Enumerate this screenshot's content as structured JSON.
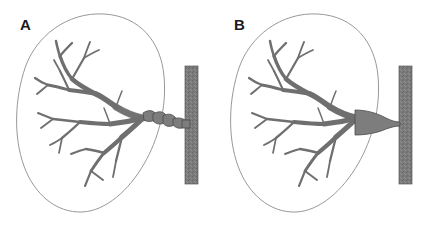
{
  "figure": {
    "width": 428,
    "height": 229,
    "background_color": "#ffffff",
    "type": "medical-illustration"
  },
  "colors": {
    "vessel_fill": "#7d7d7d",
    "vessel_stroke": "#4a4a4a",
    "aorta_fill": "#7b7b7b",
    "aorta_stroke": "#5a5a5a",
    "kidney_outline": "#8c8c8c",
    "label_color": "#1a1a1a",
    "background": "#ffffff"
  },
  "panels": [
    {
      "id": "a",
      "label": "A",
      "label_x": 20,
      "label_y": 17,
      "kidney": {
        "outline_only": true,
        "stroke_width": 0.9,
        "center_x": 92,
        "center_y": 112,
        "radius_x": 72,
        "radius_y": 99
      },
      "aorta": {
        "x": 185,
        "y": 66,
        "width": 13,
        "height": 118,
        "orientation": "vertical",
        "texture": "stippled"
      },
      "renal_artery": {
        "pattern": "beaded",
        "description": "string-of-beads alternating dilation and constriction",
        "segment_start_x": 143,
        "segment_end_x": 185,
        "bead_count": 5
      }
    },
    {
      "id": "b",
      "label": "B",
      "label_x": 20,
      "label_y": 17,
      "kidney": {
        "outline_only": true,
        "stroke_width": 0.9,
        "center_x": 92,
        "center_y": 112,
        "radius_x": 72,
        "radius_y": 99
      },
      "aorta": {
        "x": 185,
        "y": 66,
        "width": 13,
        "height": 118,
        "orientation": "vertical",
        "texture": "stippled"
      },
      "renal_artery": {
        "pattern": "focal-ostial-narrowing",
        "description": "smooth tapered focal stenosis at the aortic ostium",
        "stenosis_x": 176,
        "stenosis_width": 9
      }
    }
  ]
}
